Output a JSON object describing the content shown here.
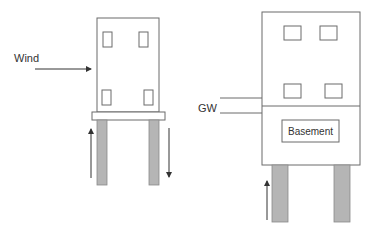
{
  "labels": {
    "wind": "Wind",
    "groundwater": "GW",
    "basement": "Basement"
  },
  "colors": {
    "line": "#6b6b6b",
    "pile_fill": "#b5b5b5",
    "arrow": "#333333",
    "text": "#333333"
  },
  "diagrams": [
    {
      "name": "building-on-piles-wind",
      "description": "Building on pile foundation under wind load; windward pile in tension (up arrow), leeward pile in compression (down arrow)"
    },
    {
      "name": "building-with-basement-groundwater",
      "description": "Building with basement below groundwater level; buoyancy uplift on piles (up arrow)"
    }
  ]
}
